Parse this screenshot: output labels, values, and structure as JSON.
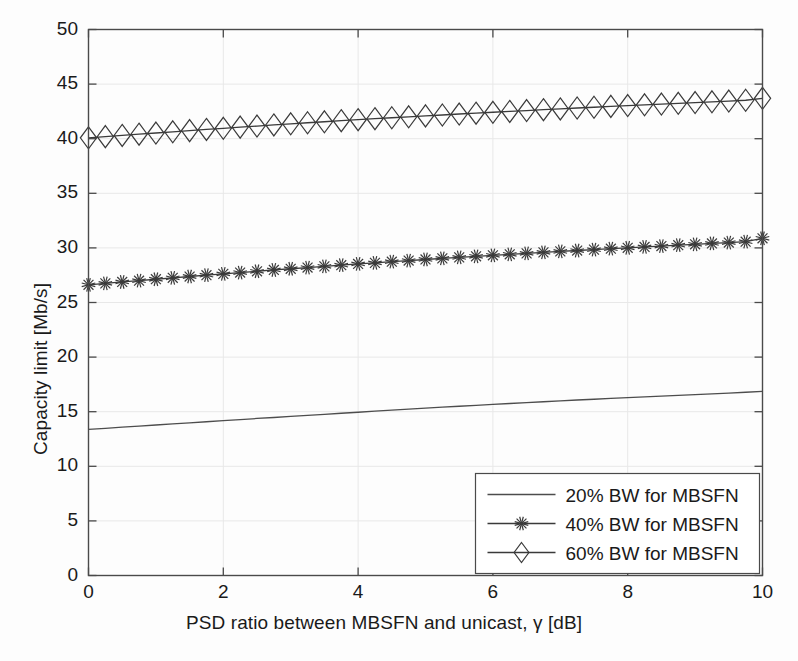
{
  "chart_data": {
    "type": "line",
    "title": "",
    "xlabel": "PSD ratio between MBSFN and unicast, γ [dB]",
    "ylabel": "Capacity limit [Mb/s]",
    "xlim": [
      0,
      10
    ],
    "ylim": [
      0,
      50
    ],
    "xticks": [
      0,
      2,
      4,
      6,
      8,
      10
    ],
    "yticks": [
      0,
      5,
      10,
      15,
      20,
      25,
      30,
      35,
      40,
      45,
      50
    ],
    "grid": true,
    "legend_position": "lower right",
    "x": [
      0,
      0.25,
      0.5,
      0.75,
      1,
      1.25,
      1.5,
      1.75,
      2,
      2.25,
      2.5,
      2.75,
      3,
      3.25,
      3.5,
      3.75,
      4,
      4.25,
      4.5,
      4.75,
      5,
      5.25,
      5.5,
      5.75,
      6,
      6.25,
      6.5,
      6.75,
      7,
      7.25,
      7.5,
      7.75,
      8,
      8.25,
      8.5,
      8.75,
      9,
      9.25,
      9.5,
      9.75,
      10
    ],
    "series": [
      {
        "name": "20% BW for MBSFN",
        "marker": "none",
        "color": "#4d4d4d",
        "values": [
          13.38,
          13.48,
          13.58,
          13.68,
          13.78,
          13.88,
          13.98,
          14.08,
          14.18,
          14.28,
          14.38,
          14.47,
          14.57,
          14.67,
          14.76,
          14.86,
          14.95,
          15.05,
          15.14,
          15.23,
          15.32,
          15.41,
          15.5,
          15.58,
          15.67,
          15.75,
          15.83,
          15.91,
          15.99,
          16.07,
          16.14,
          16.22,
          16.29,
          16.36,
          16.43,
          16.5,
          16.57,
          16.64,
          16.71,
          16.78,
          16.86
        ]
      },
      {
        "name": "40% BW for MBSFN",
        "marker": "asterisk",
        "color": "#3a3a3a",
        "values": [
          26.62,
          26.75,
          26.88,
          27.0,
          27.13,
          27.26,
          27.38,
          27.5,
          27.62,
          27.74,
          27.86,
          27.98,
          28.09,
          28.2,
          28.31,
          28.42,
          28.53,
          28.63,
          28.74,
          28.84,
          28.94,
          29.04,
          29.13,
          29.23,
          29.32,
          29.41,
          29.5,
          29.59,
          29.68,
          29.76,
          29.84,
          29.93,
          30.01,
          30.09,
          30.17,
          30.25,
          30.33,
          30.41,
          30.49,
          30.57,
          30.88
        ]
      },
      {
        "name": "60% BW for MBSFN",
        "marker": "diamond",
        "color": "#3a3a3a",
        "values": [
          40.08,
          40.19,
          40.3,
          40.41,
          40.52,
          40.63,
          40.74,
          40.85,
          40.95,
          41.06,
          41.16,
          41.26,
          41.36,
          41.46,
          41.55,
          41.65,
          41.74,
          41.83,
          41.92,
          42.0,
          42.09,
          42.17,
          42.26,
          42.34,
          42.42,
          42.5,
          42.58,
          42.66,
          42.73,
          42.81,
          42.88,
          42.96,
          43.03,
          43.1,
          43.17,
          43.24,
          43.31,
          43.38,
          43.45,
          43.52,
          43.7
        ]
      }
    ]
  },
  "axis": {
    "ytick_labels": [
      "0",
      "5",
      "10",
      "15",
      "20",
      "25",
      "30",
      "35",
      "40",
      "45",
      "50"
    ],
    "xtick_labels": [
      "0",
      "2",
      "4",
      "6",
      "8",
      "10"
    ],
    "xlabel": "PSD ratio between MBSFN and unicast, γ [dB]",
    "ylabel": "Capacity limit [Mb/s]"
  },
  "legend": {
    "entries": [
      {
        "label": "20% BW for MBSFN"
      },
      {
        "label": "40% BW for MBSFN"
      },
      {
        "label": "60% BW for MBSFN"
      }
    ]
  },
  "style": {
    "axis_color": "#4a4a4a",
    "grid_color": "#e8e8e8",
    "line_color": "#3a3a3a",
    "background": "#fdfdfd"
  }
}
